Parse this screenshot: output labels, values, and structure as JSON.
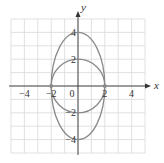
{
  "chart_data": {
    "type": "line",
    "title": "",
    "xlabel": "x",
    "ylabel": "y",
    "xlim": [
      -5,
      5
    ],
    "ylim": [
      -5,
      5
    ],
    "grid": true,
    "x_ticks": [
      -4,
      -2,
      0,
      2,
      4
    ],
    "y_ticks": [
      4,
      2,
      -2,
      -4
    ],
    "x_tick_labels": [
      "−4",
      "−2",
      "0",
      "2",
      "4"
    ],
    "y_tick_labels": [
      "4",
      "2",
      "−2",
      "−4"
    ],
    "series": [
      {
        "name": "circle",
        "shape": "circle",
        "center": [
          0,
          0
        ],
        "radius": 2,
        "equation": "x^2 + y^2 = 4"
      },
      {
        "name": "ellipse",
        "shape": "ellipse",
        "center": [
          0,
          0
        ],
        "semi_axis_x": 2,
        "semi_axis_y": 4,
        "equation": "x^2/4 + y^2/16 = 1"
      }
    ],
    "points": [
      [
        -2,
        0
      ],
      [
        2,
        0
      ]
    ],
    "colors": {
      "curve": "#8a8a8a",
      "grid": "#d9d9d9",
      "axis": "#333333"
    }
  }
}
